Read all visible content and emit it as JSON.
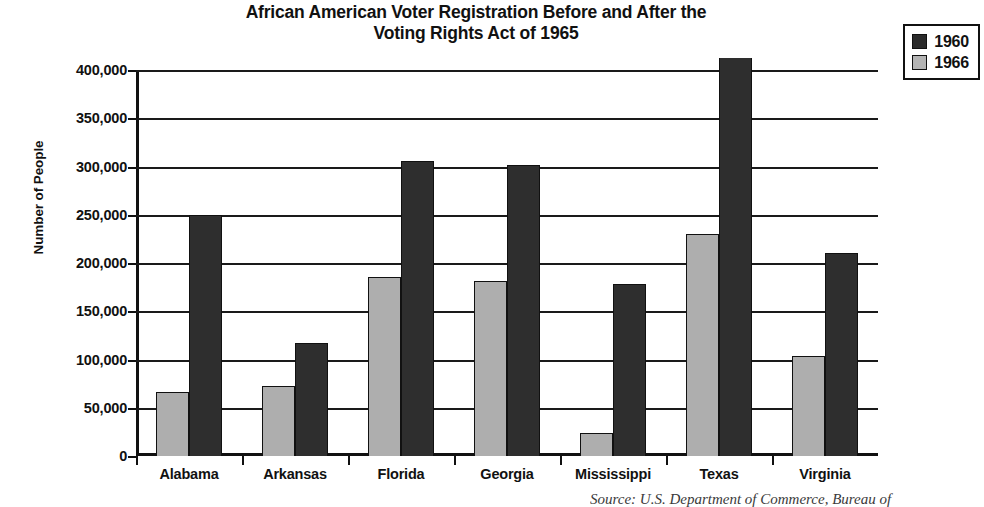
{
  "title": {
    "line1": "African American Voter Registration Before and After the",
    "line2": "Voting Rights Act of 1965"
  },
  "legend": {
    "position": "top-right",
    "entries": [
      {
        "label": "1960",
        "swatch": "dark-square-icon",
        "color": "#2b2b2b"
      },
      {
        "label": "1966",
        "swatch": "light-square-icon",
        "color": "#b4b4b4"
      }
    ]
  },
  "axes": {
    "ylabel": "Number of People",
    "ytick_labels": [
      "400,000",
      "350,000",
      "300,000",
      "250,000",
      "200,000",
      "150,000",
      "100,000",
      "50,000",
      "0"
    ],
    "xlabel": ""
  },
  "source_note": "Source: U.S. Department of Commerce, Bureau of",
  "chart_data": {
    "type": "bar",
    "title": "African American Voter Registration Before and After the Voting Rights Act of 1965",
    "xlabel": "",
    "ylabel": "Number of People",
    "ylim": [
      0,
      400000
    ],
    "ytick_values": [
      0,
      50000,
      100000,
      150000,
      200000,
      250000,
      300000,
      350000,
      400000
    ],
    "grid": true,
    "legend_position": "top-right",
    "categories": [
      "Alabama",
      "Arkansas",
      "Florida",
      "Georgia",
      "Mississippi",
      "Texas",
      "Virginia"
    ],
    "series": [
      {
        "name": "1966",
        "color": "#aeaeae",
        "values": [
          66000,
          73000,
          186000,
          181000,
          24000,
          230000,
          104000
        ]
      },
      {
        "name": "1960",
        "color": "#2e2e2e",
        "values": [
          250000,
          117000,
          306000,
          302000,
          178000,
          400000,
          210000
        ],
        "notes": [
          "",
          "",
          "",
          "",
          "",
          "bar extends past top of axis (clipped at 400,000)",
          ""
        ]
      }
    ]
  }
}
